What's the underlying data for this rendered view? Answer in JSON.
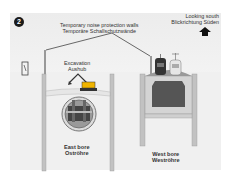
{
  "step_number": "2",
  "labels": {
    "noise_walls_en": "Temporary noise protection walls",
    "noise_walls_de": "Temporäre Schallschutzwände",
    "direction_en": "Looking south",
    "direction_de": "Blickrichtung Süden",
    "excavation_en": "Excavation",
    "excavation_de": "Aushub",
    "east_bore_en": "East bore",
    "east_bore_de": "Oströhre",
    "west_bore_en": "West bore",
    "west_bore_de": "Weströhre"
  },
  "icons": [
    "north-arrow-icon",
    "excavator-icon",
    "train-icon",
    "tram-icon",
    "traffic-light-icon",
    "tunnel-boring-machine-icon"
  ],
  "colors": {
    "background": "#f2f2f2",
    "wall": "#b5b5b5",
    "tunnel_interior": "#555555",
    "dark": "#1a1a1a"
  }
}
